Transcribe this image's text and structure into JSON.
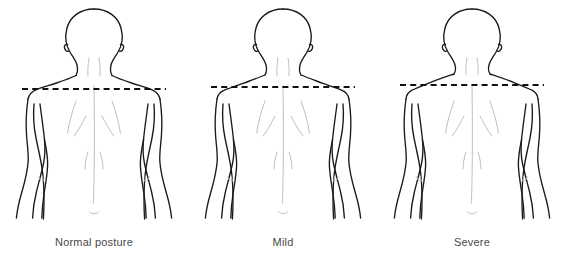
{
  "illustration": {
    "title": "Shoulder posture comparison",
    "background_color": "#ffffff",
    "outline_color": "#1a1a1a",
    "detail_color": "#b9b9b9",
    "reference_line_color": "#111111",
    "caption_color": "#494949"
  },
  "figures": [
    {
      "id": "normal",
      "caption": "Normal posture",
      "severity": "none",
      "shoulder_slope_note": "shoulders level with reference line",
      "reference_line": {
        "name": "shoulder-level-dashed-line",
        "style": "dashed",
        "y": 89,
        "x_start": 22,
        "x_end": 166
      }
    },
    {
      "id": "mild",
      "caption": "Mild",
      "severity": "mild",
      "shoulder_slope_note": "shoulders slope slightly below reference line",
      "reference_line": {
        "name": "shoulder-level-dashed-line",
        "style": "dashed",
        "y": 87,
        "x_start": 22,
        "x_end": 166
      }
    },
    {
      "id": "severe",
      "caption": "Severe",
      "severity": "severe",
      "shoulder_slope_note": "shoulders slope steeply; trapezius markedly elevated",
      "reference_line": {
        "name": "shoulder-level-dashed-line",
        "style": "dashed",
        "y": 85,
        "x_start": 22,
        "x_end": 166
      }
    }
  ],
  "anatomy_parts": [
    "head",
    "ears",
    "neck",
    "trapezius",
    "shoulders",
    "arms",
    "elbow-creases",
    "spine",
    "scapulae",
    "lower-back",
    "gluteal-cleft"
  ]
}
